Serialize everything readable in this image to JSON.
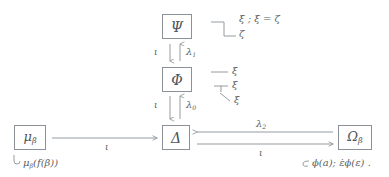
{
  "diagram": {
    "stroke_color": "#8b9196",
    "text_color": "#5a5f63",
    "background": "#ffffff",
    "nodes": [
      {
        "id": "psi",
        "label": "Ψ",
        "x": 162,
        "y": 14,
        "w": 30,
        "h": 25
      },
      {
        "id": "phi",
        "label": "Φ",
        "x": 162,
        "y": 67,
        "w": 30,
        "h": 25
      },
      {
        "id": "delta",
        "label": "Δ",
        "x": 162,
        "y": 125,
        "w": 28,
        "h": 25
      },
      {
        "id": "mu",
        "label": "μ",
        "sub": "β",
        "x": 14,
        "y": 125,
        "w": 32,
        "h": 25
      },
      {
        "id": "omega",
        "label": "Ω",
        "sub": "β",
        "x": 338,
        "y": 125,
        "w": 34,
        "h": 25
      }
    ],
    "vertical_pairs": [
      {
        "id": "psi-phi",
        "down_label": "ι",
        "up_label": "λ",
        "up_sub": "1",
        "label_y": 52
      },
      {
        "id": "phi-delta",
        "down_label": "ι",
        "up_label": "λ",
        "up_sub": "0",
        "label_y": 104
      }
    ],
    "horizontal_arrows": [
      {
        "id": "mu-to-delta",
        "label": "ι",
        "label_x": 108,
        "label_y": 145
      },
      {
        "id": "omega-to-delta",
        "label": "λ",
        "sub": "2",
        "label_x": 258,
        "label_y": 122
      },
      {
        "id": "delta-to-omega",
        "label": "ι",
        "label_x": 260,
        "label_y": 152
      }
    ],
    "annotations": [
      {
        "id": "upper-tree-line1",
        "text": "ξ ; ξ = ζ",
        "x": 239,
        "y": 17
      },
      {
        "id": "upper-tree-line2",
        "text": "ζ",
        "x": 239,
        "y": 32
      },
      {
        "id": "mid-tree-line1",
        "text": "ξ",
        "x": 234,
        "y": 68
      },
      {
        "id": "mid-tree-line2",
        "text": "ξ",
        "x": 234,
        "y": 82
      },
      {
        "id": "mid-tree-line3",
        "text": "ξ",
        "x": 236,
        "y": 96
      },
      {
        "id": "bottom-left-formula",
        "text": "μ",
        "sub": "β",
        "rest": "(f(β))",
        "x": 22,
        "y": 160
      },
      {
        "id": "bottom-right-formula",
        "text": "ϕ(a); ε̇ϕ(ε) .",
        "x": 312,
        "y": 160
      }
    ]
  }
}
